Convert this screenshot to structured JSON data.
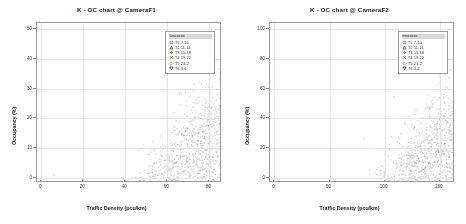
{
  "figure": {
    "background": "#ffffff",
    "panel_count": 2
  },
  "legend": {
    "title": "timezone",
    "items": [
      {
        "label": "T1 7-10",
        "marker": "circle-icon",
        "color": "#6e6e6e"
      },
      {
        "label": "T2 11-14",
        "marker": "triangle-up-icon",
        "color": "#5a5a5a"
      },
      {
        "label": "T3 15-18",
        "marker": "plus-icon",
        "color": "#777777"
      },
      {
        "label": "T4 19-22",
        "marker": "cross-icon",
        "color": "#8a8a8a"
      },
      {
        "label": "T5 23-2",
        "marker": "diamond-icon",
        "color": "#9c9c9c"
      },
      {
        "label": "T6 3-6",
        "marker": "triangle-down-icon",
        "color": "#4a4a4a"
      }
    ]
  },
  "charts": [
    {
      "id": "camera-f1",
      "chart_data": {
        "type": "scatter",
        "title": "K - OC chart @ CameraF1",
        "xlabel": "Traffic Density (pcu/km)",
        "ylabel": "Occupancy (%)",
        "xlim": [
          -2,
          85
        ],
        "ylim": [
          -1,
          52
        ],
        "xticks": [
          0,
          20,
          40,
          60,
          80
        ],
        "yticks": [
          0,
          10,
          20,
          30,
          40,
          50
        ],
        "xticklabels": [
          "0",
          "20",
          "40",
          "60",
          "80"
        ],
        "yticklabels": [
          "0",
          "10",
          "20",
          "30",
          "40",
          "50"
        ],
        "grid": true,
        "legend_position": "top-right",
        "series": [
          {
            "name": "T1 7-10",
            "color": "#6e6e6e",
            "n_points": 2600,
            "branch": "upper"
          },
          {
            "name": "T2 11-14",
            "color": "#5a5a5a",
            "n_points": 2600,
            "branch": "upper"
          },
          {
            "name": "T3 15-18",
            "color": "#777777",
            "n_points": 2600,
            "branch": "lower"
          },
          {
            "name": "T4 19-22",
            "color": "#8a8a8a",
            "n_points": 2400,
            "branch": "lower"
          },
          {
            "name": "T5 23-2",
            "color": "#9c9c9c",
            "n_points": 2000,
            "branch": "lower"
          },
          {
            "name": "T6 3-6",
            "color": "#4a4a4a",
            "n_points": 2000,
            "branch": "lower"
          }
        ],
        "cloud": {
          "upper_branch_slope": 0.78,
          "lower_branch_slope": 0.38,
          "origin": [
            0,
            0
          ],
          "max_density": 80,
          "max_occupancy": 50
        }
      }
    },
    {
      "id": "camera-f2",
      "chart_data": {
        "type": "scatter",
        "title": "K - OC chart @ CameraF2",
        "xlabel": "Traffic Density (pcu/km)",
        "ylabel": "Occupancy (%)",
        "xlim": [
          -4,
          162
        ],
        "ylim": [
          -2,
          104
        ],
        "xticks": [
          0,
          50,
          100,
          150
        ],
        "yticks": [
          0,
          20,
          40,
          60,
          80,
          100
        ],
        "xticklabels": [
          "0",
          "50",
          "100",
          "150"
        ],
        "yticklabels": [
          "0",
          "20",
          "40",
          "60",
          "80",
          "100"
        ],
        "grid": true,
        "legend_position": "top-right",
        "series": [
          {
            "name": "T1 7-10",
            "color": "#6e6e6e",
            "n_points": 2600,
            "branch": "upper"
          },
          {
            "name": "T2 11-14",
            "color": "#5a5a5a",
            "n_points": 2600,
            "branch": "upper"
          },
          {
            "name": "T3 15-18",
            "color": "#777777",
            "n_points": 2600,
            "branch": "lower"
          },
          {
            "name": "T4 19-22",
            "color": "#8a8a8a",
            "n_points": 2400,
            "branch": "lower"
          },
          {
            "name": "T5 23-2",
            "color": "#9c9c9c",
            "n_points": 2000,
            "branch": "lower"
          },
          {
            "name": "T6 3-6",
            "color": "#4a4a4a",
            "n_points": 2000,
            "branch": "lower"
          }
        ],
        "cloud": {
          "upper_branch_slope": 0.8,
          "lower_branch_slope": 0.5,
          "origin": [
            0,
            0
          ],
          "max_density": 150,
          "max_occupancy": 100
        }
      }
    }
  ]
}
